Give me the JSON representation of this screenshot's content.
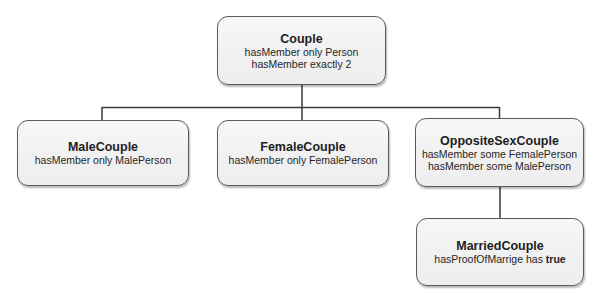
{
  "diagram": {
    "type": "class-hierarchy",
    "nodes": [
      {
        "id": "couple",
        "title": "Couple",
        "restrictions": [
          "hasMember only Person",
          "hasMember exactly 2"
        ]
      },
      {
        "id": "male_couple",
        "title": "MaleCouple",
        "restrictions": [
          "hasMember only MalePerson"
        ]
      },
      {
        "id": "female_couple",
        "title": "FemaleCouple",
        "restrictions": [
          "hasMember only FemalePerson"
        ]
      },
      {
        "id": "opposite_sex_couple",
        "title": "OppositeSexCouple",
        "restrictions": [
          "hasMember some FemalePerson",
          "hasMember some MalePerson"
        ]
      },
      {
        "id": "married_couple",
        "title": "MarriedCouple",
        "restriction_prefix": "hasProofOfMarrige has ",
        "restriction_value": "true"
      }
    ],
    "edges": [
      {
        "from": "couple",
        "to": "male_couple"
      },
      {
        "from": "couple",
        "to": "female_couple"
      },
      {
        "from": "couple",
        "to": "opposite_sex_couple"
      },
      {
        "from": "opposite_sex_couple",
        "to": "married_couple"
      }
    ],
    "colors": {
      "line": "#3a3a3a",
      "node_border": "#5a5a5a",
      "node_fill": "#f2f2f2",
      "text": "#222222"
    }
  }
}
